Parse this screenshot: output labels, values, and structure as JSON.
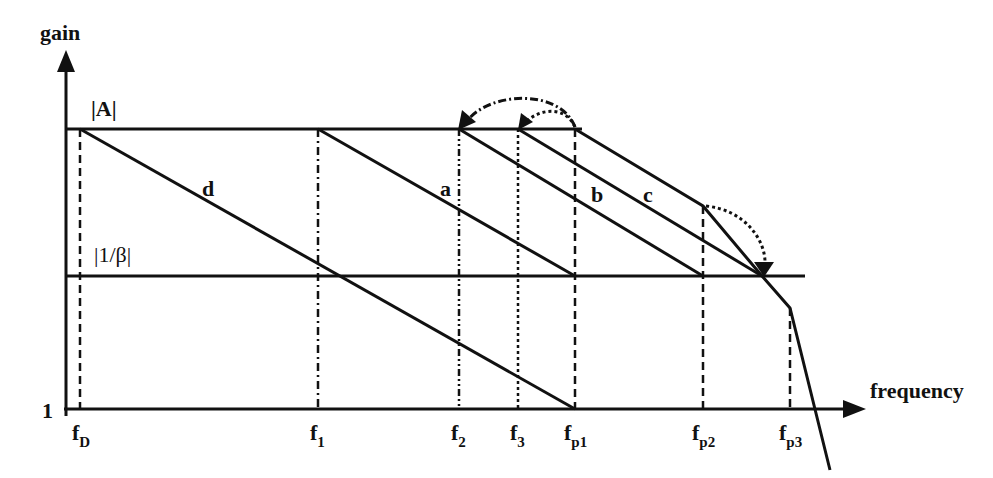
{
  "diagram": {
    "type": "bode-magnitude-compensation",
    "axes": {
      "y_label": "gain",
      "x_label": "frequency",
      "y_origin_label": "1"
    },
    "levels": {
      "open_loop": "|A|",
      "feedback": "|1/β|"
    },
    "curves": [
      {
        "id": "d",
        "label": "d"
      },
      {
        "id": "a",
        "label": "a"
      },
      {
        "id": "b",
        "label": "b"
      },
      {
        "id": "c",
        "label": "c"
      }
    ],
    "frequencies": [
      {
        "base": "f",
        "sub": "D"
      },
      {
        "base": "f",
        "sub": "1"
      },
      {
        "base": "f",
        "sub": "2"
      },
      {
        "base": "f",
        "sub": "3"
      },
      {
        "base": "f",
        "sub": "p1"
      },
      {
        "base": "f",
        "sub": "p2"
      },
      {
        "base": "f",
        "sub": "p3"
      }
    ],
    "colors": {
      "line": "#111111",
      "background": "#ffffff"
    }
  }
}
